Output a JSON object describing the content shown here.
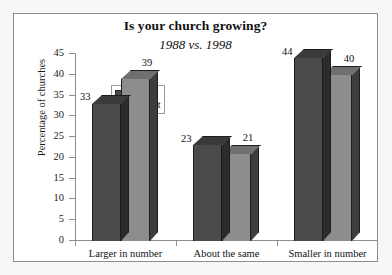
{
  "figure": {
    "title": "Is your church growing?",
    "subtitle": "1988 vs. 1998",
    "frame_color": "#8d8d8d",
    "background": "#ffffff"
  },
  "legend": {
    "position": "inside-upper-left-of-plot",
    "entries": [
      {
        "label": "Largest",
        "swatch": "#4a4a4a"
      },
      {
        "label": "Smallest",
        "swatch": "#8d8d8d"
      }
    ]
  },
  "axes": {
    "y": {
      "title": "Percentage of churches",
      "ticks": [
        "45",
        "40",
        "35",
        "30",
        "25",
        "20",
        "15",
        "10",
        "5",
        "0"
      ]
    },
    "x": {
      "title": "",
      "ticks": [
        "Larger in number",
        "About the same",
        "Smaller in number"
      ]
    }
  },
  "chart_data": {
    "type": "bar",
    "title": "Is your church growing?",
    "subtitle": "1988 vs. 1998",
    "xlabel": "",
    "ylabel": "Percentage of churches",
    "ylim": [
      0,
      45
    ],
    "ytick_step": 5,
    "grid": false,
    "legend_position": "upper left (inside plot)",
    "style": "3d-clustered-column",
    "categories": [
      "Larger in number",
      "About the same",
      "Smaller in number"
    ],
    "series": [
      {
        "name": "Largest",
        "color": "#4a4a4a",
        "values": [
          33,
          23,
          44
        ]
      },
      {
        "name": "Smallest",
        "color": "#8d8d8d",
        "values": [
          39,
          21,
          40
        ]
      }
    ],
    "data_labels": [
      {
        "category": "Larger in number",
        "series": "Largest",
        "value": 33
      },
      {
        "category": "Larger in number",
        "series": "Smallest",
        "value": 39
      },
      {
        "category": "About the same",
        "series": "Largest",
        "value": 23
      },
      {
        "category": "About the same",
        "series": "Smallest",
        "value": 21
      },
      {
        "category": "Smaller in number",
        "series": "Largest",
        "value": 44
      },
      {
        "category": "Smaller in number",
        "series": "Smallest",
        "value": 40
      }
    ]
  }
}
